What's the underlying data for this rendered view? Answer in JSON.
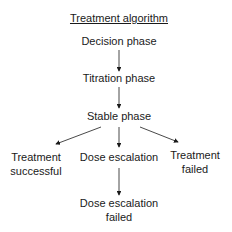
{
  "diagram": {
    "title": "Treatment algorithm",
    "nodes": {
      "decision": "Decision phase",
      "titration": "Titration phase",
      "stable": "Stable phase",
      "success_l1": "Treatment",
      "success_l2": "successful",
      "escalation": "Dose escalation",
      "failed_l1": "Treatment",
      "failed_l2": "failed",
      "esc_failed_l1": "Dose escalation",
      "esc_failed_l2": "failed"
    },
    "edges": [
      [
        "Decision phase",
        "Titration phase"
      ],
      [
        "Titration phase",
        "Stable phase"
      ],
      [
        "Stable phase",
        "Treatment successful"
      ],
      [
        "Stable phase",
        "Dose escalation"
      ],
      [
        "Stable phase",
        "Treatment failed"
      ],
      [
        "Dose escalation",
        "Dose escalation failed"
      ]
    ]
  }
}
